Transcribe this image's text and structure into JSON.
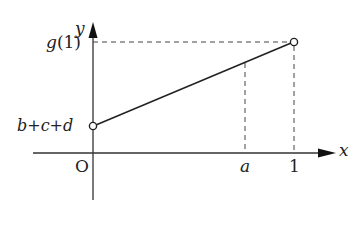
{
  "diagram": {
    "axes": {
      "x_label": "x",
      "y_label": "y",
      "origin_label": "O"
    },
    "y_labels": {
      "top": "g(1)",
      "intercept": "b+c+d"
    },
    "x_labels": {
      "a": "a",
      "one": "1"
    },
    "segment": {
      "start": "open circle at (0, b+c+d)",
      "end": "open circle at (1, g(1))"
    },
    "colors": {
      "line": "#222222",
      "background": "#ffffff"
    }
  }
}
